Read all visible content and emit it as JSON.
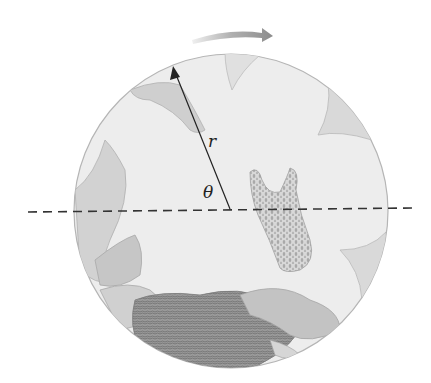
{
  "figure": {
    "type": "rotating-disk-diagram",
    "labels": {
      "radius": "r",
      "angle": "θ"
    },
    "colors": {
      "background": "#ffffff",
      "disk_fill": "#ededed",
      "disk_edge": "#b5b5b5",
      "lobe_fill": "#d9d9d9",
      "fold_fill": "#c8c8c8",
      "dark_mass": "#8a8a8a",
      "line": "#222222",
      "dashed_axis": "#333333",
      "rotation_arrow": "#9a9a9a"
    },
    "geometry": {
      "center": [
        230,
        210
      ],
      "radius_px": 157,
      "radius_vector_tip": [
        173,
        68
      ],
      "axis_from": [
        28,
        212
      ],
      "axis_to": [
        412,
        208
      ]
    },
    "icons": {
      "rotation": "clockwise-arrow-icon",
      "radius": "arrow-up-left-icon"
    }
  }
}
